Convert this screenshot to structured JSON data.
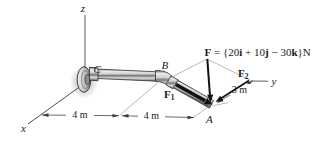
{
  "diagram": {
    "title_hidden": "",
    "axes": {
      "x": "x",
      "y": "y",
      "z": "z"
    },
    "points": {
      "a": "A",
      "b": "B",
      "c": "C"
    },
    "force_equation": {
      "f": "F",
      "part1": " = {20",
      "i": "i",
      "part2": " + 10",
      "j": "j",
      "part3": " − 30",
      "k": "k",
      "part4": "}N"
    },
    "force_labels": {
      "f1": {
        "sym": "F",
        "sub": "1"
      },
      "f2": {
        "sym": "F",
        "sub": "2"
      }
    },
    "dimensions": {
      "left": "4 m",
      "middle": "4 m",
      "right": "3 m"
    },
    "colors": {
      "ink": "#1a1a1a",
      "axis_line": "#3a3a3a",
      "construction_line": "#9b9b9b",
      "pipe_outline": "#2f2f2f",
      "pipe_metal_light": "#e8e8e8",
      "pipe_metal_dark": "#6a6a6a",
      "background": "#ffffff"
    }
  }
}
